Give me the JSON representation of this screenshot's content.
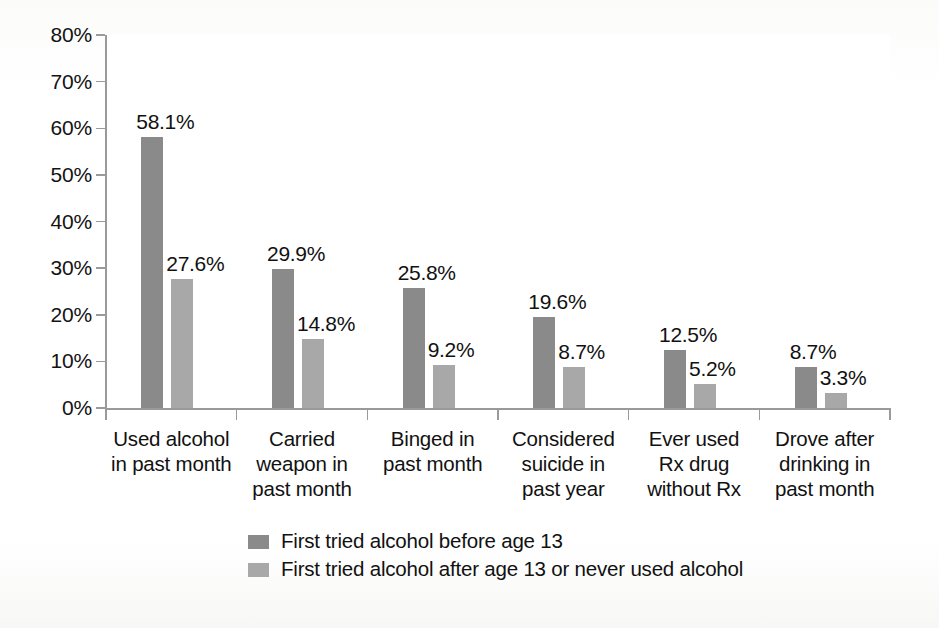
{
  "chart_data": {
    "type": "bar",
    "title": "",
    "subtitle": "",
    "xlabel": "",
    "ylabel": "",
    "ylim": [
      0,
      80
    ],
    "ytick_values": [
      80,
      70,
      60,
      50,
      40,
      30,
      20,
      10,
      0
    ],
    "ytick_labels": [
      "80%",
      "70%",
      "60%",
      "50%",
      "40%",
      "30%",
      "20%",
      "10%",
      "0%"
    ],
    "grid": false,
    "legend_position": "bottom-center",
    "categories": [
      "Used alcohol in past month",
      "Carried weapon in past month",
      "Binged in past month",
      "Considered suicide in past year",
      "Ever used Rx drug without Rx",
      "Drove after drinking in past month"
    ],
    "category_label_lines": [
      [
        "Used alcohol",
        "in past month"
      ],
      [
        "Carried",
        "weapon in",
        "past month"
      ],
      [
        "Binged in",
        "past month"
      ],
      [
        "Considered",
        "suicide in",
        "past year"
      ],
      [
        "Ever used",
        "Rx drug",
        "without Rx"
      ],
      [
        "Drove after",
        "drinking in",
        "past month"
      ]
    ],
    "series": [
      {
        "name": "First tried alcohol before age 13",
        "color": "#8a8a8a",
        "values": [
          58.1,
          29.9,
          25.8,
          19.6,
          12.5,
          8.7
        ],
        "value_labels": [
          "58.1%",
          "29.9%",
          "25.8%",
          "19.6%",
          "12.5%",
          "8.7%"
        ]
      },
      {
        "name": "First tried alcohol after age 13 or never used alcohol",
        "color": "#a8a8a8",
        "values": [
          27.6,
          14.8,
          9.2,
          8.7,
          5.2,
          3.3
        ],
        "value_labels": [
          "27.6%",
          "14.8%",
          "9.2%",
          "8.7%",
          "5.2%",
          "3.3%"
        ]
      }
    ]
  },
  "legend": {
    "items": [
      {
        "label": "First tried alcohol before age 13",
        "color": "#8a8a8a"
      },
      {
        "label": "First tried alcohol after age 13 or never used alcohol",
        "color": "#a8a8a8"
      }
    ]
  }
}
